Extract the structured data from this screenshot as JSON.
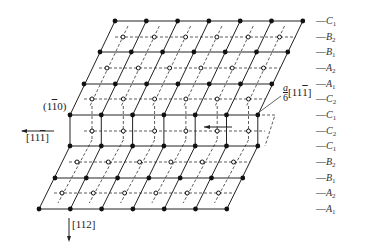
{
  "diagram": {
    "plane_label": "(1̅1̅0)",
    "plane_label_text": "(1",
    "plane_label_bar": "1",
    "plane_label_end": "0)",
    "direction_left": {
      "text": "[11",
      "bar": "1",
      "end": "]"
    },
    "direction_down": {
      "text": "[112]"
    },
    "shear": {
      "frac_num": "a",
      "frac_den": "6",
      "dir_text": "[11",
      "dir_bar": "1",
      "dir_end": "]"
    },
    "layers": [
      {
        "letter": "C",
        "sub": "1",
        "y": 21
      },
      {
        "letter": "B",
        "sub": "2",
        "y": 37
      },
      {
        "letter": "B",
        "sub": "1",
        "y": 52
      },
      {
        "letter": "A",
        "sub": "2",
        "y": 68
      },
      {
        "letter": "A",
        "sub": "1",
        "y": 84
      },
      {
        "letter": "C",
        "sub": "2",
        "y": 99
      },
      {
        "letter": "C",
        "sub": "1",
        "y": 115
      },
      {
        "letter": "C",
        "sub": "2",
        "y": 131
      },
      {
        "letter": "C",
        "sub": "1",
        "y": 146
      },
      {
        "letter": "B",
        "sub": "2",
        "y": 162
      },
      {
        "letter": "B",
        "sub": "1",
        "y": 178
      },
      {
        "letter": "A",
        "sub": "2",
        "y": 193
      },
      {
        "letter": "A",
        "sub": "1",
        "y": 209
      }
    ],
    "colors": {
      "line": "#222222",
      "dot": "#111111",
      "dashed": "#333333"
    }
  }
}
